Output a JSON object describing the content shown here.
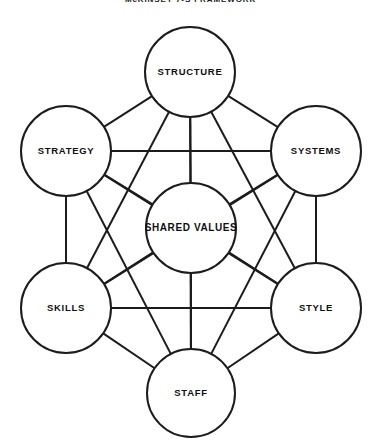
{
  "title": "McKINSEY 7-S FRAMEWORK",
  "canvas": {
    "width": 381,
    "height": 446
  },
  "colors": {
    "stroke": "#1c1c1c",
    "fill": "#ffffff",
    "text": "#101010",
    "background": "#ffffff"
  },
  "chart_data": {
    "type": "diagram",
    "diagram_type": "network",
    "title": "McKINSEY 7-S FRAMEWORK",
    "layout": "hexagon-with-center",
    "node_radius": 45,
    "connectivity": "complete-graph-k7",
    "edge_count": 21,
    "nodes": [
      {
        "id": "structure",
        "label": "STRUCTURE",
        "cx": 190,
        "cy": 72,
        "r": 45,
        "position": "top"
      },
      {
        "id": "systems",
        "label": "SYSTEMS",
        "cx": 316,
        "cy": 151,
        "r": 45,
        "position": "upper-right"
      },
      {
        "id": "style",
        "label": "STYLE",
        "cx": 316,
        "cy": 308,
        "r": 45,
        "position": "lower-right"
      },
      {
        "id": "staff",
        "label": "STAFF",
        "cx": 191,
        "cy": 393,
        "r": 44,
        "position": "bottom"
      },
      {
        "id": "skills",
        "label": "SKILLS",
        "cx": 66,
        "cy": 308,
        "r": 45,
        "position": "lower-left"
      },
      {
        "id": "strategy",
        "label": "STRATEGY",
        "cx": 66,
        "cy": 151,
        "r": 45,
        "position": "upper-left"
      },
      {
        "id": "shared_values",
        "label": "SHARED VALUES",
        "cx": 191,
        "cy": 228,
        "r": 45,
        "position": "center"
      }
    ],
    "edges": [
      {
        "from": "structure",
        "to": "systems"
      },
      {
        "from": "structure",
        "to": "style"
      },
      {
        "from": "structure",
        "to": "staff"
      },
      {
        "from": "structure",
        "to": "skills"
      },
      {
        "from": "structure",
        "to": "strategy"
      },
      {
        "from": "structure",
        "to": "shared_values"
      },
      {
        "from": "systems",
        "to": "style"
      },
      {
        "from": "systems",
        "to": "staff"
      },
      {
        "from": "systems",
        "to": "skills"
      },
      {
        "from": "systems",
        "to": "strategy"
      },
      {
        "from": "systems",
        "to": "shared_values"
      },
      {
        "from": "style",
        "to": "staff"
      },
      {
        "from": "style",
        "to": "skills"
      },
      {
        "from": "style",
        "to": "strategy"
      },
      {
        "from": "style",
        "to": "shared_values"
      },
      {
        "from": "staff",
        "to": "skills"
      },
      {
        "from": "staff",
        "to": "strategy"
      },
      {
        "from": "staff",
        "to": "shared_values"
      },
      {
        "from": "skills",
        "to": "strategy"
      },
      {
        "from": "skills",
        "to": "shared_values"
      },
      {
        "from": "strategy",
        "to": "shared_values"
      }
    ]
  }
}
